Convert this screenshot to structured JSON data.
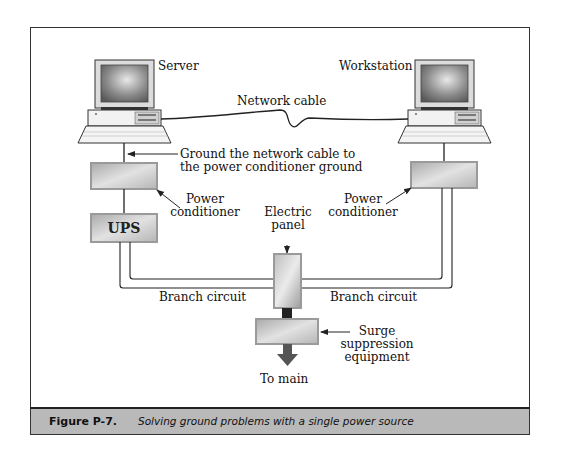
{
  "diagram": {
    "nodes": {
      "server": {
        "label": "Server"
      },
      "workstation": {
        "label": "Workstation"
      },
      "server_power_conditioner": {
        "label_line1": "Power",
        "label_line2": "conditioner"
      },
      "workstation_power_conditioner": {
        "label_line1": "Power",
        "label_line2": "conditioner"
      },
      "ups": {
        "label": "UPS"
      },
      "electric_panel": {
        "label_line1": "Electric",
        "label_line2": "panel"
      },
      "surge_suppression": {
        "label_line1": "Surge",
        "label_line2": "suppression",
        "label_line3": "equipment"
      },
      "to_main": {
        "label": "To main"
      }
    },
    "edges": {
      "network_cable": {
        "label": "Network cable"
      },
      "ground_note": {
        "label_line1": "Ground the network cable to",
        "label_line2": "the power conditioner ground"
      },
      "branch_left": {
        "label": "Branch circuit"
      },
      "branch_right": {
        "label": "Branch circuit"
      }
    }
  },
  "caption": {
    "figure_label": "Figure P-7.",
    "text": "Solving ground problems with a single power source"
  },
  "colors": {
    "caption_band": "#b9b9b9",
    "box_fill": "#c8c8c8",
    "line": "#222222",
    "arrow_dark": "#555555"
  }
}
